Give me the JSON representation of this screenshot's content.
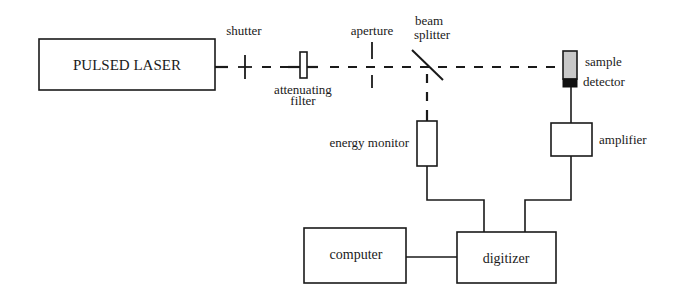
{
  "diagram": {
    "type": "optical-setup-block-diagram",
    "components": {
      "laser": {
        "label": "PULSED LASER"
      },
      "shutter": {
        "label": "shutter"
      },
      "filter": {
        "label_line1": "attenuating",
        "label_line2": "filter"
      },
      "aperture": {
        "label": "aperture"
      },
      "beam_splitter": {
        "label_line1": "beam",
        "label_line2": "splitter"
      },
      "sample": {
        "label": "sample"
      },
      "detector": {
        "label": "detector"
      },
      "energy_monitor": {
        "label": "energy monitor"
      },
      "amplifier": {
        "label": "amplifier"
      },
      "computer": {
        "label": "computer"
      },
      "digitizer": {
        "label": "digitizer"
      }
    },
    "colors": {
      "line": "#1a1a1a",
      "sample_fill": "#c8c8c8",
      "detector_fill": "#111111",
      "background": "#ffffff"
    },
    "connections": [
      {
        "from": "PULSED LASER",
        "to": "sample",
        "style": "dashed",
        "via": [
          "shutter",
          "attenuating filter",
          "aperture",
          "beam splitter"
        ]
      },
      {
        "from": "beam splitter",
        "to": "energy monitor",
        "style": "dashed"
      },
      {
        "from": "detector",
        "to": "amplifier",
        "style": "solid"
      },
      {
        "from": "energy monitor",
        "to": "digitizer",
        "style": "solid"
      },
      {
        "from": "amplifier",
        "to": "digitizer",
        "style": "solid"
      },
      {
        "from": "computer",
        "to": "digitizer",
        "style": "solid"
      }
    ]
  }
}
